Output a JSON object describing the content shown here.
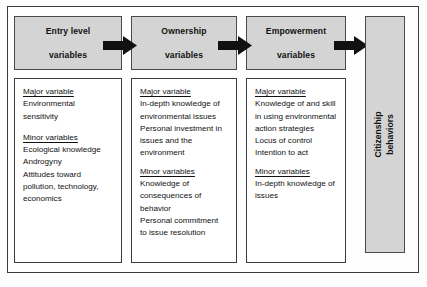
{
  "diagram": {
    "colors": {
      "box_fill": "#d4d4d4",
      "box_border": "#4a4a4a",
      "body_fill": "#ffffff",
      "body_border": "#3a3a3a",
      "arrow": "#111111",
      "frame": "#3c3c3c"
    },
    "stages": [
      {
        "header": "Entry level\nvariables",
        "header_line1": "Entry level",
        "header_line2": "variables",
        "groups": [
          {
            "heading": "Major variable",
            "items": [
              "Environmental",
              "sensitivity"
            ]
          },
          {
            "heading": "Minor variables",
            "items": [
              "Ecological knowledge",
              "Androgyny",
              "Attitudes toward",
              "pollution, technology,",
              "economics"
            ]
          }
        ]
      },
      {
        "header": "Ownership\nvariables",
        "header_line1": "Ownership",
        "header_line2": "variables",
        "groups": [
          {
            "heading": "Major variable",
            "items": [
              "In-depth knowledge of",
              "environmental issues",
              "Personal investment in",
              "issues and the",
              "environment"
            ]
          },
          {
            "heading": "Minor variables",
            "items": [
              "Knowledge of",
              "consequences of",
              "behavior",
              "Personal commitment",
              "to issue resolution"
            ]
          }
        ]
      },
      {
        "header": "Empowerment\nvariables",
        "header_line1": "Empowerment",
        "header_line2": "variables",
        "groups": [
          {
            "heading": "Major variable",
            "items": [
              "Knowledge of and skill",
              "in using environmental",
              "action strategies",
              "Locus of control",
              "Intention to act"
            ]
          },
          {
            "heading": "Minor variables",
            "items": [
              "In-depth knowledge of",
              "issues"
            ]
          }
        ]
      }
    ],
    "outcome": {
      "label_line1": "Citizenship",
      "label_line2": "behaviors"
    },
    "arrows": [
      {
        "name": "arrow-entry-to-ownership"
      },
      {
        "name": "arrow-ownership-to-empowerment"
      },
      {
        "name": "arrow-empowerment-to-citizenship"
      }
    ]
  }
}
